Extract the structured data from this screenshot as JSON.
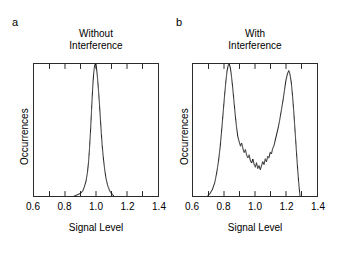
{
  "figure": {
    "background_color": "#ffffff",
    "line_color": "#2b2b2b",
    "marker_color": "#1a1a1a"
  },
  "panels": [
    {
      "letter": "a",
      "title_line1": "Without",
      "title_line2": "Interference",
      "xlabel": "Signal Level",
      "ylabel": "Occurrences"
    },
    {
      "letter": "b",
      "title_line1": "With",
      "title_line2": "Interference",
      "xlabel": "Signal Level",
      "ylabel": "Occurrences"
    }
  ],
  "axis": {
    "xticklabels": [
      "0.6",
      "0.8",
      "1.0",
      "1.2",
      "1.4"
    ],
    "xtickvalues": [
      0.6,
      0.8,
      1.0,
      1.2,
      1.4
    ],
    "minor_tick_values": [
      0.7,
      0.8,
      0.9,
      1.0,
      1.1,
      1.2,
      1.3
    ]
  },
  "chart_data": [
    {
      "type": "line",
      "title": "Without Interference",
      "xlabel": "Signal Level",
      "ylabel": "Occurrences",
      "xlim": [
        0.6,
        1.4
      ],
      "ylim": [
        0,
        1.0
      ],
      "grid": false,
      "legend": "none",
      "linestyle": "dotted",
      "description": "Single narrow unimodal peak centered near 0.99",
      "x": [
        0.86,
        0.88,
        0.9,
        0.915,
        0.925,
        0.935,
        0.945,
        0.952,
        0.958,
        0.964,
        0.97,
        0.975,
        0.98,
        0.985,
        0.99,
        0.995,
        1.0,
        1.005,
        1.01,
        1.016,
        1.022,
        1.028,
        1.034,
        1.04,
        1.048,
        1.056,
        1.065,
        1.075,
        1.088,
        1.1,
        1.115
      ],
      "y": [
        0.0,
        0.01,
        0.02,
        0.04,
        0.07,
        0.11,
        0.18,
        0.26,
        0.36,
        0.48,
        0.62,
        0.74,
        0.85,
        0.93,
        0.98,
        1.0,
        0.99,
        0.95,
        0.89,
        0.8,
        0.7,
        0.59,
        0.48,
        0.38,
        0.28,
        0.2,
        0.13,
        0.08,
        0.04,
        0.02,
        0.0
      ]
    },
    {
      "type": "line",
      "title": "With Interference",
      "xlabel": "Signal Level",
      "ylabel": "Occurrences",
      "xlim": [
        0.6,
        1.4
      ],
      "ylim": [
        0,
        1.0
      ],
      "grid": false,
      "legend": "none",
      "linestyle": "dotted",
      "description": "Bimodal distribution with peaks near 0.83 and 1.22 and a noisy valley between",
      "x": [
        0.695,
        0.71,
        0.725,
        0.74,
        0.752,
        0.764,
        0.775,
        0.785,
        0.795,
        0.805,
        0.813,
        0.82,
        0.827,
        0.834,
        0.841,
        0.848,
        0.856,
        0.864,
        0.872,
        0.88,
        0.889,
        0.898,
        0.906,
        0.914,
        0.922,
        0.93,
        0.938,
        0.946,
        0.954,
        0.962,
        0.97,
        0.978,
        0.986,
        0.994,
        1.002,
        1.01,
        1.018,
        1.026,
        1.034,
        1.042,
        1.05,
        1.058,
        1.066,
        1.074,
        1.082,
        1.09,
        1.098,
        1.106,
        1.114,
        1.122,
        1.13,
        1.14,
        1.15,
        1.16,
        1.17,
        1.18,
        1.19,
        1.2,
        1.21,
        1.218,
        1.226,
        1.234,
        1.242,
        1.25,
        1.258,
        1.266,
        1.274,
        1.282,
        1.29
      ],
      "y": [
        0.0,
        0.02,
        0.05,
        0.1,
        0.17,
        0.26,
        0.37,
        0.5,
        0.64,
        0.78,
        0.88,
        0.95,
        0.99,
        1.0,
        0.97,
        0.91,
        0.82,
        0.72,
        0.62,
        0.53,
        0.45,
        0.41,
        0.38,
        0.4,
        0.36,
        0.33,
        0.35,
        0.31,
        0.29,
        0.31,
        0.27,
        0.25,
        0.28,
        0.24,
        0.22,
        0.25,
        0.21,
        0.23,
        0.2,
        0.23,
        0.26,
        0.24,
        0.28,
        0.26,
        0.3,
        0.29,
        0.33,
        0.32,
        0.36,
        0.38,
        0.42,
        0.47,
        0.52,
        0.58,
        0.65,
        0.72,
        0.8,
        0.88,
        0.93,
        0.95,
        0.92,
        0.86,
        0.76,
        0.64,
        0.5,
        0.36,
        0.22,
        0.1,
        0.0
      ]
    }
  ]
}
